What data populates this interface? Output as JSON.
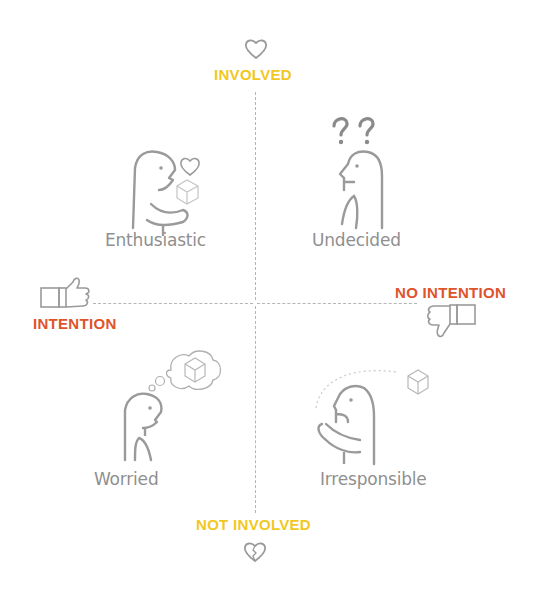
{
  "axes": {
    "top": {
      "label": "INVOLVED",
      "icon": "heart-icon",
      "color": "#f2c81f"
    },
    "bottom": {
      "label": "NOT INVOLVED",
      "icon": "broken-heart-icon",
      "color": "#f2c81f"
    },
    "left": {
      "label": "INTENTION",
      "icon": "thumbs-up-icon",
      "color": "#e0532a"
    },
    "right": {
      "label": "NO INTENTION",
      "icon": "thumbs-down-icon",
      "color": "#e0532a"
    }
  },
  "quadrants": [
    {
      "position": "top-left",
      "label": "Enthusiastic",
      "icon": "person-holding-cube-with-heart-icon"
    },
    {
      "position": "top-right",
      "label": "Undecided",
      "icon": "person-with-question-marks-icon"
    },
    {
      "position": "bottom-left",
      "label": "Worried",
      "icon": "person-thinking-of-cube-icon"
    },
    {
      "position": "bottom-right",
      "label": "Irresponsible",
      "icon": "person-throwing-cube-icon"
    }
  ],
  "colors": {
    "figure_stroke": "#9a9a9a",
    "dashed_axis": "#b5b5b5",
    "label_gray": "#8f8f8f"
  }
}
